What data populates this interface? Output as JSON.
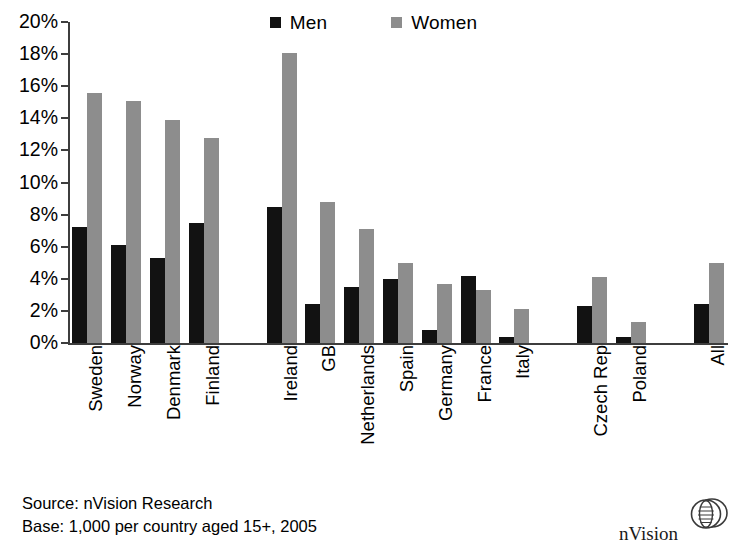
{
  "legend": {
    "entries": [
      {
        "label": "Men",
        "color": "#121212",
        "swatch": "square-marker-icon"
      },
      {
        "label": "Women",
        "color": "#8d8d8d",
        "swatch": "square-marker-icon"
      }
    ]
  },
  "footer": {
    "line1": "Source: nVision Research",
    "line2": "Base: 1,000 per country aged 15+, 2005"
  },
  "brand": {
    "name": "nVision",
    "logo_icon": "nvision-globe-icon"
  },
  "chart_data": {
    "type": "bar",
    "title": "",
    "subtitle": "",
    "xlabel": "",
    "ylabel": "",
    "ylim": [
      0,
      20
    ],
    "ytick_step": 2,
    "grid": false,
    "legend_position": "top-center",
    "value_unit": "percent",
    "ytick_labels": [
      "20%",
      "18%",
      "16%",
      "14%",
      "12%",
      "10%",
      "8%",
      "6%",
      "4%",
      "2%",
      "0%"
    ],
    "categories": [
      "Sweden",
      "Norway",
      "Denmark",
      "Finland",
      "Ireland",
      "GB",
      "Netherlands",
      "Spain",
      "Germany",
      "France",
      "Italy",
      "Czech Rep",
      "Poland",
      "All"
    ],
    "group_breaks_after": [
      "Finland",
      "Italy",
      "Poland"
    ],
    "series": [
      {
        "name": "Men",
        "color": "#121212",
        "values": [
          7.2,
          6.1,
          5.3,
          7.5,
          8.5,
          2.4,
          3.5,
          4.0,
          0.8,
          4.2,
          0.4,
          2.3,
          0.4,
          2.4
        ]
      },
      {
        "name": "Women",
        "color": "#8d8d8d",
        "values": [
          15.6,
          15.1,
          13.9,
          12.8,
          18.1,
          8.8,
          7.1,
          5.0,
          3.7,
          3.3,
          2.1,
          4.1,
          1.3,
          5.0
        ]
      }
    ]
  }
}
